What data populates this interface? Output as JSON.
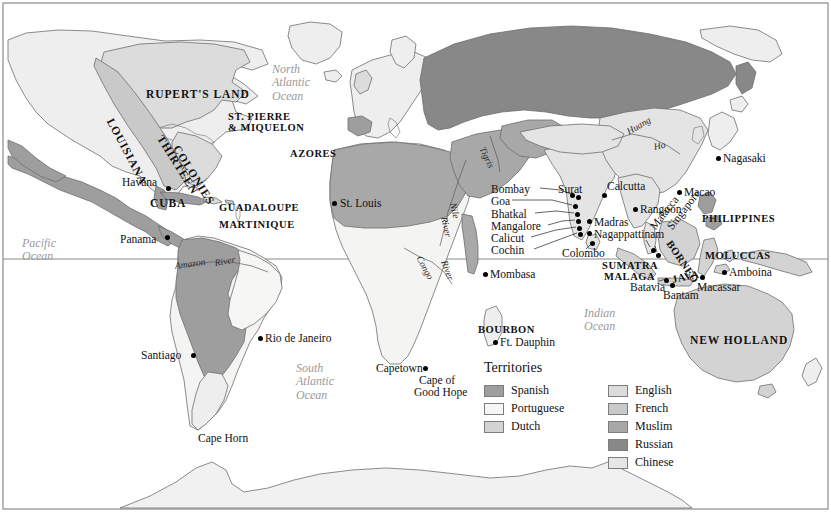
{
  "map": {
    "frame_color": "#8a8a8a",
    "background": "#ffffff",
    "equator_color": "#8a8a8a"
  },
  "palette": {
    "spanish": "#9e9e9e",
    "portuguese": "#f4f4f2",
    "dutch": "#d3d3d3",
    "english": "#dcdcdc",
    "french": "#c9c9c9",
    "muslim": "#a8a8a8",
    "russian": "#888888",
    "chinese": "#e4e4e4",
    "unclaimed": "#eeeeee",
    "coastline": "#6f6f6f"
  },
  "legend": {
    "title": "Territories",
    "left_column": [
      {
        "label": "Spanish",
        "color": "#9e9e9e"
      },
      {
        "label": "Portuguese",
        "color": "#f6f6f4"
      },
      {
        "label": "Dutch",
        "color": "#d3d3d3"
      }
    ],
    "right_column": [
      {
        "label": "English",
        "color": "#dcdcdc"
      },
      {
        "label": "French",
        "color": "#c9c9c9"
      },
      {
        "label": "Muslim",
        "color": "#a8a8a8"
      },
      {
        "label": "Russian",
        "color": "#888888"
      },
      {
        "label": "Chinese",
        "color": "#e6e6e6"
      }
    ]
  },
  "oceans": [
    {
      "name": "North Atlantic Ocean",
      "lines": [
        "North",
        "Atlantic",
        "Ocean"
      ],
      "x": 272,
      "y": 63
    },
    {
      "name": "Pacific Ocean",
      "lines": [
        "Pacific",
        "Ocean"
      ],
      "x": 22,
      "y": 237
    },
    {
      "name": "South Atlantic Ocean",
      "lines": [
        "South",
        "Atlantic",
        "Ocean"
      ],
      "x": 296,
      "y": 362
    },
    {
      "name": "Indian Ocean",
      "lines": [
        "Indian",
        "Ocean"
      ],
      "x": 584,
      "y": 307
    }
  ],
  "regions": [
    {
      "label": "RUPERT'S LAND",
      "x": 146,
      "y": 88,
      "size": "lg",
      "rotate": 0
    },
    {
      "label": "ST. PIERRE",
      "x": 228,
      "y": 111,
      "size": "sm",
      "rotate": 0
    },
    {
      "label": "& MIQUELON",
      "x": 228,
      "y": 122,
      "size": "sm",
      "rotate": 0
    },
    {
      "label": "LOUISIANA",
      "x": 110,
      "y": 113,
      "size": "lg",
      "rotate": 62
    },
    {
      "label": "THIRTEEN",
      "x": 160,
      "y": 130,
      "size": "lg",
      "rotate": 58
    },
    {
      "label": "COLONIES",
      "x": 176,
      "y": 140,
      "size": "lg",
      "rotate": 58
    },
    {
      "label": "AZORES",
      "x": 290,
      "y": 148,
      "size": "sm",
      "rotate": 0
    },
    {
      "label": "CUBA",
      "x": 150,
      "y": 197,
      "size": "lg",
      "rotate": 0
    },
    {
      "label": "GUADALOUPE",
      "x": 219,
      "y": 202,
      "size": "sm",
      "rotate": 0
    },
    {
      "label": "MARTINIQUE",
      "x": 219,
      "y": 219,
      "size": "sm",
      "rotate": 0
    },
    {
      "label": "PHILIPPINES",
      "x": 702,
      "y": 213,
      "size": "sm",
      "rotate": 0
    },
    {
      "label": "MOLUCCAS",
      "x": 705,
      "y": 250,
      "size": "sm",
      "rotate": 0
    },
    {
      "label": "SUMATRA",
      "x": 602,
      "y": 260,
      "size": "sm",
      "rotate": 0
    },
    {
      "label": "MALAGA",
      "x": 604,
      "y": 271,
      "size": "sm",
      "rotate": 0
    },
    {
      "label": "JAVA",
      "x": 672,
      "y": 274,
      "size": "sm",
      "rotate": -12
    },
    {
      "label": "BORNEO",
      "x": 669,
      "y": 236,
      "size": "sm",
      "rotate": 56
    },
    {
      "label": "NEW HOLLAND",
      "x": 690,
      "y": 334,
      "size": "lg",
      "rotate": 0
    },
    {
      "label": "BOURBON",
      "x": 478,
      "y": 324,
      "size": "sm",
      "rotate": 0
    }
  ],
  "cities": [
    {
      "name": "Havana",
      "x": 122,
      "y": 176,
      "dot_x": 166,
      "dot_y": 186,
      "anchor": "left"
    },
    {
      "name": "Panama",
      "x": 120,
      "y": 233,
      "dot_x": 165,
      "dot_y": 235,
      "anchor": "left"
    },
    {
      "name": "St. Louis",
      "x": 340,
      "y": 197,
      "dot_x": 332,
      "dot_y": 201,
      "anchor": "left"
    },
    {
      "name": "Santiago",
      "x": 141,
      "y": 349,
      "dot_x": 191,
      "dot_y": 353,
      "anchor": "left"
    },
    {
      "name": "Rio de Janeiro",
      "x": 265,
      "y": 332,
      "dot_x": 258,
      "dot_y": 336,
      "anchor": "left"
    },
    {
      "name": "Cape Horn",
      "x": 198,
      "y": 432,
      "dot_x": -99,
      "dot_y": -99,
      "anchor": "left"
    },
    {
      "name": "Capetown",
      "x": 376,
      "y": 362,
      "dot_x": 423,
      "dot_y": 366,
      "anchor": "left"
    },
    {
      "name": "Cape of",
      "x": 419,
      "y": 374,
      "dot_x": -99,
      "dot_y": -99,
      "anchor": "left"
    },
    {
      "name": "Good Hope",
      "x": 414,
      "y": 386,
      "dot_x": -99,
      "dot_y": -99,
      "anchor": "left"
    },
    {
      "name": "Mombasa",
      "x": 490,
      "y": 268,
      "dot_x": 483,
      "dot_y": 272,
      "anchor": "left"
    },
    {
      "name": "Ft. Dauphin",
      "x": 500,
      "y": 336,
      "dot_x": 493,
      "dot_y": 340,
      "anchor": "left"
    },
    {
      "name": "Bombay",
      "x": 491,
      "y": 183,
      "dot_x": 576,
      "dot_y": 195,
      "anchor": "left"
    },
    {
      "name": "Goa",
      "x": 491,
      "y": 195,
      "dot_x": 573,
      "dot_y": 204,
      "anchor": "left"
    },
    {
      "name": "Bhatkal",
      "x": 491,
      "y": 208,
      "dot_x": 575,
      "dot_y": 212,
      "anchor": "left"
    },
    {
      "name": "Mangalore",
      "x": 491,
      "y": 220,
      "dot_x": 576,
      "dot_y": 219,
      "anchor": "left"
    },
    {
      "name": "Calicut",
      "x": 491,
      "y": 232,
      "dot_x": 577,
      "dot_y": 226,
      "anchor": "left"
    },
    {
      "name": "Cochin",
      "x": 491,
      "y": 244,
      "dot_x": 578,
      "dot_y": 232,
      "anchor": "left"
    },
    {
      "name": "Surat",
      "x": 558,
      "y": 183,
      "dot_x": 570,
      "dot_y": 193,
      "anchor": "left"
    },
    {
      "name": "Calcutta",
      "x": 607,
      "y": 180,
      "dot_x": 602,
      "dot_y": 193,
      "anchor": "left"
    },
    {
      "name": "Madras",
      "x": 594,
      "y": 216,
      "dot_x": 587,
      "dot_y": 219,
      "anchor": "left"
    },
    {
      "name": "Nagappattinam",
      "x": 594,
      "y": 228,
      "dot_x": 587,
      "dot_y": 231,
      "anchor": "left"
    },
    {
      "name": "Colombo",
      "x": 562,
      "y": 247,
      "dot_x": 590,
      "dot_y": 241,
      "anchor": "left"
    },
    {
      "name": "Rangoon",
      "x": 640,
      "y": 203,
      "dot_x": 633,
      "dot_y": 207,
      "anchor": "left"
    },
    {
      "name": "Macao",
      "x": 684,
      "y": 186,
      "dot_x": 677,
      "dot_y": 190,
      "anchor": "left"
    },
    {
      "name": "Nagasaki",
      "x": 723,
      "y": 152,
      "dot_x": 716,
      "dot_y": 156,
      "anchor": "left"
    },
    {
      "name": "Malacca",
      "x": 652,
      "y": 222,
      "dot_x": 651,
      "dot_y": 248,
      "anchor": "left",
      "rotate": -52
    },
    {
      "name": "Singapore",
      "x": 669,
      "y": 222,
      "dot_x": 656,
      "dot_y": 253,
      "anchor": "left",
      "rotate": -52
    },
    {
      "name": "Batavia",
      "x": 630,
      "y": 281,
      "dot_x": 664,
      "dot_y": 278,
      "anchor": "left"
    },
    {
      "name": "Bantam",
      "x": 663,
      "y": 289,
      "dot_x": 670,
      "dot_y": 283,
      "anchor": "left"
    },
    {
      "name": "Macassar",
      "x": 697,
      "y": 281,
      "dot_x": 700,
      "dot_y": 275,
      "anchor": "left"
    },
    {
      "name": "Amboina",
      "x": 729,
      "y": 266,
      "dot_x": 722,
      "dot_y": 270,
      "anchor": "left"
    }
  ],
  "rivers": [
    {
      "name": "Nile",
      "x": 452,
      "y": 198,
      "rotate": 78
    },
    {
      "name": "River",
      "x": 443,
      "y": 212,
      "rotate": 78
    },
    {
      "name": "Congo",
      "x": 418,
      "y": 252,
      "rotate": 62
    },
    {
      "name": "River",
      "x": 443,
      "y": 256,
      "rotate": 70
    },
    {
      "name": "Amazon",
      "x": 175,
      "y": 262,
      "rotate": -8
    },
    {
      "name": "River",
      "x": 215,
      "y": 259,
      "rotate": -10
    },
    {
      "name": "Tigris",
      "x": 481,
      "y": 143,
      "rotate": 64
    },
    {
      "name": "Huang",
      "x": 628,
      "y": 128,
      "rotate": -30
    },
    {
      "name": "Ho",
      "x": 654,
      "y": 143,
      "rotate": -12
    }
  ]
}
